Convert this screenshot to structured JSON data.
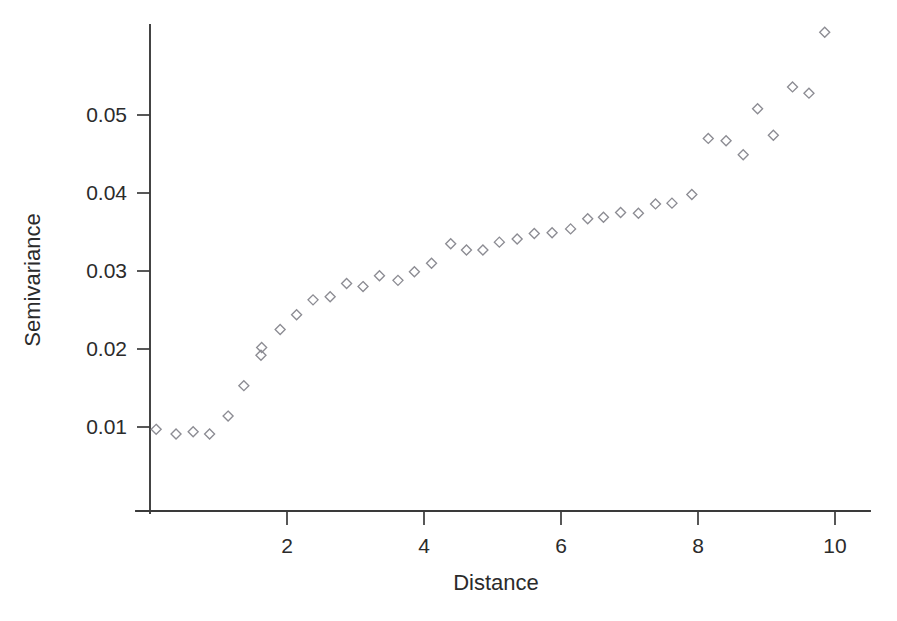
{
  "chart_data": {
    "type": "scatter",
    "title": "",
    "xlabel": "Distance",
    "ylabel": "Semivariance",
    "xlim": [
      0,
      10.5
    ],
    "ylim": [
      0,
      0.0605
    ],
    "xticks": [
      2,
      4,
      6,
      8,
      10
    ],
    "xtick_labels": [
      "2",
      "4",
      "6",
      "8",
      "10"
    ],
    "yticks": [
      0.01,
      0.02,
      0.03,
      0.04,
      0.05
    ],
    "ytick_labels": [
      "0.01",
      "0.02",
      "0.03",
      "0.04",
      "0.05"
    ],
    "grid": false,
    "legend": null,
    "marker": "open-diamond",
    "marker_color": "#8c8c93",
    "series": [
      {
        "name": "Experimental semivariogram",
        "points": [
          [
            0.09,
            0.0097
          ],
          [
            0.38,
            0.0091
          ],
          [
            0.63,
            0.0094
          ],
          [
            0.87,
            0.0091
          ],
          [
            1.14,
            0.0114
          ],
          [
            1.37,
            0.0153
          ],
          [
            1.62,
            0.0192
          ],
          [
            1.63,
            0.0202
          ],
          [
            1.9,
            0.0225
          ],
          [
            2.14,
            0.0244
          ],
          [
            2.38,
            0.0263
          ],
          [
            2.63,
            0.0267
          ],
          [
            2.87,
            0.0284
          ],
          [
            3.11,
            0.028
          ],
          [
            3.35,
            0.0294
          ],
          [
            3.62,
            0.0288
          ],
          [
            3.86,
            0.0299
          ],
          [
            4.11,
            0.031
          ],
          [
            4.39,
            0.0335
          ],
          [
            4.62,
            0.0327
          ],
          [
            4.86,
            0.0327
          ],
          [
            5.1,
            0.0337
          ],
          [
            5.36,
            0.0341
          ],
          [
            5.61,
            0.0348
          ],
          [
            5.87,
            0.0349
          ],
          [
            6.14,
            0.0354
          ],
          [
            6.39,
            0.0367
          ],
          [
            6.62,
            0.0369
          ],
          [
            6.87,
            0.0375
          ],
          [
            7.13,
            0.0374
          ],
          [
            7.38,
            0.0386
          ],
          [
            7.62,
            0.0387
          ],
          [
            7.91,
            0.0398
          ],
          [
            8.15,
            0.047
          ],
          [
            8.41,
            0.0467
          ],
          [
            8.66,
            0.0449
          ],
          [
            8.87,
            0.0508
          ],
          [
            9.1,
            0.0474
          ],
          [
            9.38,
            0.0536
          ],
          [
            9.62,
            0.0528
          ],
          [
            9.85,
            0.0606
          ]
        ]
      }
    ]
  },
  "geometry": {
    "plot_left": 150,
    "plot_right": 870,
    "plot_bottom": 511,
    "plot_top": 25,
    "x_scale_px_per_unit": 68.5,
    "y_zero_px": 505,
    "y_scale_px_per_unit": 7800
  }
}
